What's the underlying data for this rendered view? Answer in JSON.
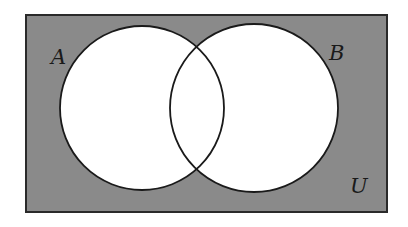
{
  "diagram": {
    "type": "venn",
    "title": "",
    "universe": {
      "label": "U",
      "x": 26,
      "y": 15,
      "width": 361,
      "height": 197,
      "fill": "#8a8a8a",
      "stroke": "#2a2a2a",
      "label_x": 350,
      "label_y": 193
    },
    "sets": [
      {
        "label": "A",
        "cx": 142,
        "cy": 108,
        "r": 82,
        "fill": "#ffffff",
        "stroke": "#1a1a1a",
        "label_x": 51,
        "label_y": 64
      },
      {
        "label": "B",
        "cx": 254,
        "cy": 108,
        "r": 84,
        "fill": "#ffffff",
        "stroke": "#1a1a1a",
        "label_x": 329,
        "label_y": 60
      }
    ],
    "shaded_region": "complement of (A ∪ B)",
    "shade_color": "#8a8a8a"
  }
}
